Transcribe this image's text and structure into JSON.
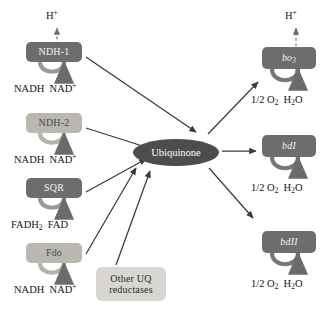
{
  "diagram": {
    "type": "biochemical-pathway",
    "canvas": {
      "width": 329,
      "height": 317
    },
    "colors": {
      "dark_box": "#6d6d6d",
      "light_box": "#b9b7b0",
      "plain_box": "#d8d6d0",
      "hub": "#4d4d4d",
      "arrow": "#3a3a3a",
      "text": "#141414"
    }
  },
  "hub": {
    "name": "ubiquinone-node",
    "label": "Ubiquinone",
    "x": 133,
    "y": 139,
    "width": 86,
    "height": 27
  },
  "dehydrogenases": [
    {
      "id": "ndh1",
      "label": "NDH-1",
      "shade": "dark",
      "x": 26,
      "y": 42,
      "width": 56,
      "height": 20,
      "substrate": "NADH",
      "product": "NAD",
      "product_charge": "+",
      "substrate_label_x": 14,
      "substrate_label_y": 83,
      "pumps_proton": true,
      "proton_label": "H",
      "proton_charge": "+",
      "proton_x": 46,
      "proton_y": 10
    },
    {
      "id": "ndh2",
      "label": "NDH-2",
      "shade": "light",
      "x": 26,
      "y": 113,
      "width": 56,
      "height": 20,
      "substrate": "NADH",
      "product": "NAD",
      "product_charge": "+",
      "substrate_label_x": 14,
      "substrate_label_y": 154,
      "pumps_proton": false
    },
    {
      "id": "sqr",
      "label": "SQR",
      "shade": "dark",
      "x": 26,
      "y": 178,
      "width": 56,
      "height": 20,
      "substrate": "FADH2",
      "product": "FAD",
      "product_charge": "",
      "substrate_label_x": 14,
      "substrate_label_y": 219,
      "pumps_proton": false
    },
    {
      "id": "fdo",
      "label": "Fdo",
      "shade": "light",
      "x": 26,
      "y": 243,
      "width": 56,
      "height": 20,
      "substrate": "NADH",
      "product": "NAD",
      "product_charge": "+",
      "substrate_label_x": 14,
      "substrate_label_y": 284,
      "pumps_proton": false
    }
  ],
  "other_reductases": {
    "id": "other-uq",
    "line1": "Other UQ",
    "line2": "reductases",
    "x": 96,
    "y": 267,
    "width": 70,
    "height": 34
  },
  "oxidases": [
    {
      "id": "bo3",
      "label": "bo",
      "subscript": "3",
      "shade": "dark",
      "x": 262,
      "y": 47,
      "width": 54,
      "height": 22,
      "substrate": "1/2 O2",
      "product": "H2O",
      "substrate_label_x": 251,
      "substrate_label_y": 94,
      "pumps_proton": true,
      "proton_label": "H",
      "proton_charge": "+",
      "proton_x": 285,
      "proton_y": 10
    },
    {
      "id": "bdI",
      "label": "bdI",
      "subscript": "",
      "shade": "dark",
      "x": 262,
      "y": 135,
      "width": 54,
      "height": 22,
      "substrate": "1/2 O2",
      "product": "H2O",
      "substrate_label_x": 251,
      "substrate_label_y": 182,
      "pumps_proton": false
    },
    {
      "id": "bdII",
      "label": "bdII",
      "subscript": "",
      "shade": "dark",
      "x": 262,
      "y": 231,
      "width": 54,
      "height": 22,
      "substrate": "1/2 O2",
      "product": "H2O",
      "substrate_label_x": 251,
      "substrate_label_y": 278,
      "pumps_proton": false
    }
  ],
  "text_nodes": {
    "nadh": "NADH",
    "nad_plus": "NAD",
    "fadh2_base": "FADH",
    "fadh2_sub": "2",
    "fad": "FAD",
    "half_o2_prefix": "1/2 O",
    "half_o2_sub": "2",
    "h2o_h": "H",
    "h2o_sub": "2",
    "h2o_o": "O",
    "proton": "H",
    "plus": "+"
  },
  "edges": [
    {
      "from": "ndh1",
      "to": "ubiquinone",
      "style": "solid",
      "direction": "in"
    },
    {
      "from": "ndh2",
      "to": "ubiquinone",
      "style": "solid",
      "direction": "in"
    },
    {
      "from": "sqr",
      "to": "ubiquinone",
      "style": "solid",
      "direction": "in"
    },
    {
      "from": "fdo",
      "to": "ubiquinone",
      "style": "solid",
      "direction": "in"
    },
    {
      "from": "other-uq",
      "to": "ubiquinone",
      "style": "solid",
      "direction": "in"
    },
    {
      "from": "ubiquinone",
      "to": "bo3",
      "style": "solid",
      "direction": "out"
    },
    {
      "from": "ubiquinone",
      "to": "bdI",
      "style": "solid",
      "direction": "out"
    },
    {
      "from": "ubiquinone",
      "to": "bdII",
      "style": "solid",
      "direction": "out"
    }
  ]
}
